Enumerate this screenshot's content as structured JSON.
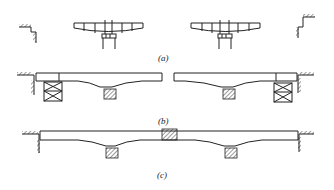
{
  "figure": {
    "panels": [
      {
        "id": "a",
        "label": "(a)",
        "caption": "Balanced cantilever segments on piers with abutments"
      },
      {
        "id": "b",
        "label": "(b)",
        "caption": "Side spans completed on falsework towers"
      },
      {
        "id": "c",
        "label": "(c)",
        "caption": "Midspan closure joint completed continuous girder"
      }
    ]
  },
  "colors": {
    "line": "#222222",
    "background": "#ffffff"
  }
}
